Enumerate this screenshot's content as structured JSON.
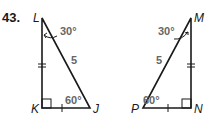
{
  "problem_number": "43.",
  "colors": {
    "line": "#1a1a1a",
    "label": "#666666"
  },
  "left_triangle": {
    "vertices": {
      "top": "L",
      "bottom_left": "K",
      "bottom_right": "J"
    },
    "angle_top": "30°",
    "angle_bottom_right": "60°",
    "hypotenuse": "5",
    "right_angle_at": "K"
  },
  "right_triangle": {
    "vertices": {
      "top": "M",
      "bottom_right": "N",
      "bottom_left": "P"
    },
    "angle_top": "30°",
    "angle_bottom_left": "60°",
    "hypotenuse": "5",
    "right_angle_at": "N"
  }
}
